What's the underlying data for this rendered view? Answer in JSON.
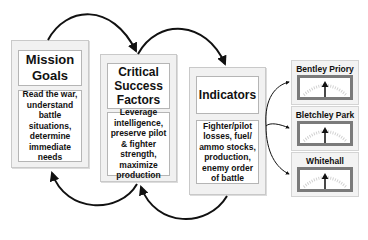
{
  "diagram": {
    "boxes": [
      {
        "title": "Mission Goals",
        "title_lines": [
          "Mission",
          "Goals"
        ],
        "body": "Read the war, understand battle situations, determine immediate needs"
      },
      {
        "title": "Critical Success Factors",
        "title_lines": [
          "Critical",
          "Success",
          "Factors"
        ],
        "body": "Leverage intelligence, preserve pilot & fighter strength, maximize production"
      },
      {
        "title": "Indicators",
        "title_lines": [
          "Indicators"
        ],
        "body": "Fighter/pilot losses, fuel/ ammo stocks, production, enemy order of battle"
      }
    ],
    "gauges": [
      {
        "label": "Bentley Priory"
      },
      {
        "label": "Bletchley Park"
      },
      {
        "label": "Whitehall"
      }
    ],
    "connectors": [
      {
        "from": "Mission Goals",
        "to": "Critical Success Factors",
        "icon": "curved-arrow-icon"
      },
      {
        "from": "Critical Success Factors",
        "to": "Indicators",
        "icon": "curved-arrow-icon"
      },
      {
        "from": "Indicators",
        "to": "Critical Success Factors",
        "icon": "curved-arrow-icon"
      },
      {
        "from": "Critical Success Factors",
        "to": "Mission Goals",
        "icon": "curved-arrow-icon"
      },
      {
        "from": "Indicators",
        "to": "Bentley Priory",
        "icon": "arrow-icon"
      },
      {
        "from": "Indicators",
        "to": "Bletchley Park",
        "icon": "arrow-icon"
      },
      {
        "from": "Indicators",
        "to": "Whitehall",
        "icon": "arrow-icon"
      }
    ],
    "colors": {
      "line": "#111111",
      "box_fill": "#f1f1f1",
      "gauge_border": "#7b7b7b"
    }
  }
}
